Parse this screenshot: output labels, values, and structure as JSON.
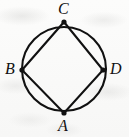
{
  "figure": {
    "kind": "geometry-diagram",
    "background_color": "#fbfbfa",
    "ink_color": "#111111",
    "stroke_width": 2,
    "circle": {
      "center_x": 64,
      "center_y": 69,
      "radius": 42
    },
    "vertices": [
      {
        "id": "C",
        "label": "C",
        "x": 64,
        "y": 22,
        "label_x": 58,
        "label_y": 1,
        "position": "top"
      },
      {
        "id": "B",
        "label": "B",
        "x": 22,
        "y": 70,
        "label_x": 5,
        "label_y": 61,
        "position": "left"
      },
      {
        "id": "D",
        "label": "D",
        "x": 103,
        "y": 70,
        "label_x": 110,
        "label_y": 61,
        "position": "right"
      },
      {
        "id": "A",
        "label": "A",
        "x": 64,
        "y": 113,
        "label_x": 58,
        "label_y": 118,
        "position": "bottom"
      }
    ],
    "edges": [
      {
        "from": "B",
        "to": "C"
      },
      {
        "from": "C",
        "to": "D"
      },
      {
        "from": "D",
        "to": "A"
      },
      {
        "from": "A",
        "to": "B"
      }
    ],
    "quadrilateral_path": "M 64 22 L 103 70 L 64 113 L 22 70 Z"
  }
}
